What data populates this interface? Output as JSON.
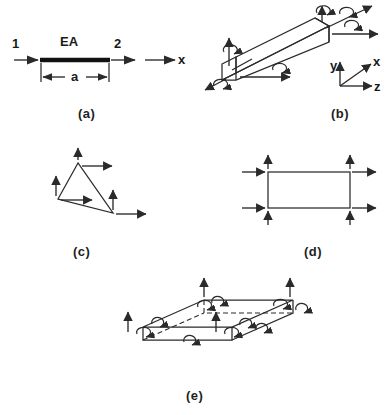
{
  "figure": {
    "background": "#ffffff",
    "ink_color": "#2a2a2a",
    "panels": [
      {
        "id": "a",
        "label": "(a)",
        "title": "axial bar element",
        "annotations": {
          "node_1": "1",
          "node_2": "2",
          "stiffness": "EA",
          "length": "a",
          "axis": "x"
        }
      },
      {
        "id": "b",
        "label": "(b)",
        "title": "three dimensional beam element",
        "annotations": {
          "axis_x": "x",
          "axis_y": "y",
          "axis_z": "z"
        }
      },
      {
        "id": "c",
        "label": "(c)",
        "title": "triangular plane element"
      },
      {
        "id": "d",
        "label": "(d)",
        "title": "rectangular plane element"
      },
      {
        "id": "e",
        "label": "(e)",
        "title": "plate bending element"
      }
    ]
  }
}
